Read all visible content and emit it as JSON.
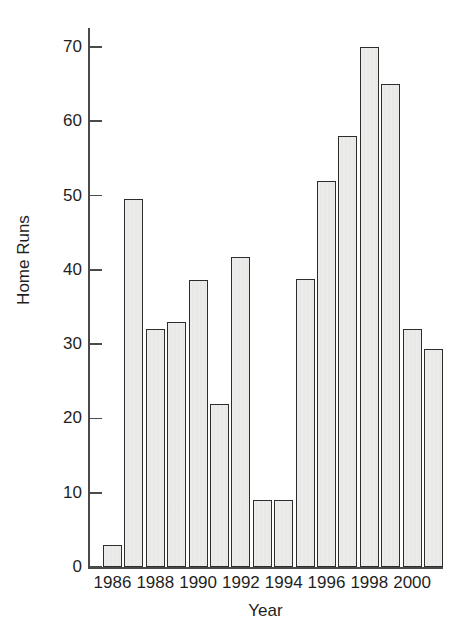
{
  "figure": {
    "title_fragment": "Home Runs by Year",
    "background_color": "#ffffff",
    "axis_color": "#4a4a4a",
    "bar_fill_color": "#ececeb",
    "bar_edge_color": "#2c2c2c"
  },
  "chart_data": {
    "type": "bar",
    "title": "",
    "xlabel": "Year",
    "ylabel": "Home Runs",
    "categories": [
      "1986",
      "1987",
      "1988",
      "1989",
      "1990",
      "1991",
      "1992",
      "1993",
      "1994",
      "1995",
      "1996",
      "1997",
      "1998",
      "1999",
      "2000",
      "2001"
    ],
    "values": [
      3,
      49.5,
      32,
      33,
      38.7,
      22,
      41.7,
      9,
      9,
      38.8,
      52,
      58,
      70,
      65,
      32,
      29.3
    ],
    "ylim": [
      0,
      74
    ],
    "xlim": [
      1985.5,
      2001.5
    ],
    "yticks": [
      0,
      10,
      20,
      30,
      40,
      50,
      60,
      70
    ],
    "ytick_labels": [
      "0",
      "10",
      "20",
      "30",
      "40",
      "50",
      "60",
      "70"
    ],
    "xticks": [
      1986,
      1988,
      1990,
      1992,
      1994,
      1996,
      1998,
      2000
    ],
    "xtick_labels": [
      "1986",
      "1988",
      "1990",
      "1992",
      "1994",
      "1996",
      "1998",
      "2000"
    ],
    "grid": false,
    "legend": null,
    "bar_width_fraction": 0.89,
    "annotations": []
  }
}
